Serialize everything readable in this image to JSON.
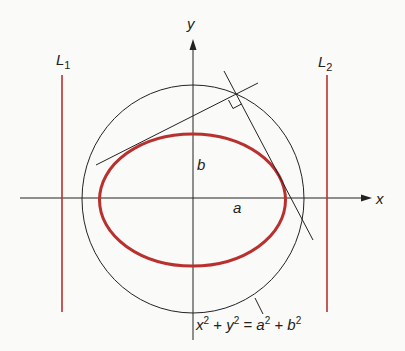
{
  "diagram": {
    "axes": {
      "x_label": "x",
      "y_label": "y"
    },
    "lines": {
      "left_label_main": "L",
      "left_label_sub": "1",
      "right_label_main": "L",
      "right_label_sub": "2"
    },
    "ellipse": {
      "semi_major_label": "a",
      "semi_minor_label": "b"
    },
    "circle_equation": {
      "x": "x",
      "sup1": "2",
      "plus1": " + ",
      "y": "y",
      "sup2": "2",
      "eq": " = ",
      "a": "a",
      "sup3": "2",
      "plus2": " + ",
      "b": "b",
      "sup4": "2"
    },
    "colors": {
      "ellipse": "#b8312f",
      "directrix_lines": "#b8312f",
      "ink": "#222222"
    }
  }
}
